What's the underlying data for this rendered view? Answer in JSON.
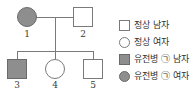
{
  "diagram": {
    "type": "pedigree-chart",
    "generations": 2,
    "individuals": [
      {
        "id": "1",
        "label": "1",
        "sex": "female",
        "shape": "circle",
        "affected": true,
        "generation": 1,
        "role": "mother"
      },
      {
        "id": "2",
        "label": "2",
        "sex": "male",
        "shape": "square",
        "affected": false,
        "generation": 1,
        "role": "father"
      },
      {
        "id": "3",
        "label": "3",
        "sex": "male",
        "shape": "square",
        "affected": true,
        "generation": 2,
        "role": "child"
      },
      {
        "id": "4",
        "label": "4",
        "sex": "female",
        "shape": "circle",
        "affected": false,
        "generation": 2,
        "role": "child"
      },
      {
        "id": "5",
        "label": "5",
        "sex": "male",
        "shape": "square",
        "affected": false,
        "generation": 2,
        "role": "child"
      }
    ],
    "mating_line": "1-2",
    "sibship": [
      "3",
      "4",
      "5"
    ]
  },
  "legend": {
    "items": [
      {
        "symbol": "open-square",
        "shape": "square",
        "filled": false,
        "label": "정상 남자"
      },
      {
        "symbol": "open-circle",
        "shape": "circle",
        "filled": false,
        "label": "정상 여자"
      },
      {
        "symbol": "filled-square",
        "shape": "square",
        "filled": true,
        "label": "유전병 ㉠ 남자"
      },
      {
        "symbol": "filled-circle",
        "shape": "circle",
        "filled": true,
        "label": "유전병 ㉠ 여자"
      }
    ]
  },
  "colors": {
    "affected_fill": "#8e8e8e",
    "stroke": "#7a7a7a",
    "text": "#2f2f2f",
    "background": "#ffffff"
  }
}
